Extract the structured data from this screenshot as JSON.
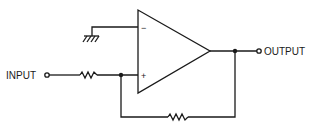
{
  "diagram": {
    "type": "circuit-schematic",
    "title": "",
    "component": "op-amp",
    "labels": {
      "input": "INPUT",
      "output": "OUTPUT",
      "inverting": "−",
      "non_inverting": "+"
    },
    "elements": [
      {
        "id": "opamp",
        "type": "operational-amplifier"
      },
      {
        "id": "r_in",
        "type": "resistor",
        "between": [
          "INPUT",
          "+ input"
        ]
      },
      {
        "id": "r_fb",
        "type": "resistor",
        "between": [
          "+ input",
          "OUTPUT"
        ],
        "role": "feedback"
      },
      {
        "id": "gnd",
        "type": "ground",
        "connected_to": "− input"
      }
    ],
    "colors": {
      "line": "#1a1a1a",
      "background": "#ffffff"
    }
  }
}
